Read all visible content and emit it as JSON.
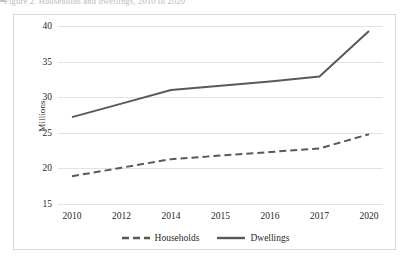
{
  "caption": {
    "bullet_icon": "square-bullet-icon",
    "text": "Figure 2.  Households and dwellings, 2010 to 2020"
  },
  "chart_data": {
    "type": "line",
    "title": "",
    "xlabel": "",
    "ylabel": "Millions",
    "categories": [
      "2010",
      "2012",
      "2014",
      "2015",
      "2016",
      "2017",
      "2020"
    ],
    "ylim": [
      15,
      40
    ],
    "yticks": [
      15,
      20,
      25,
      30,
      35,
      40
    ],
    "grid": true,
    "legend_position": "bottom",
    "series": [
      {
        "name": "Households",
        "style": "dashed",
        "color": "#595959",
        "values": [
          18.9,
          20.1,
          21.3,
          21.8,
          22.3,
          22.8,
          24.8
        ]
      },
      {
        "name": "Dwellings",
        "style": "solid",
        "color": "#595959",
        "values": [
          27.2,
          29.1,
          31.0,
          31.6,
          32.2,
          32.9,
          39.3
        ]
      }
    ]
  },
  "colors": {
    "line": "#595959",
    "grid": "#e2e2e6",
    "frame": "#d8d8dc",
    "text": "#1f1f1f"
  }
}
